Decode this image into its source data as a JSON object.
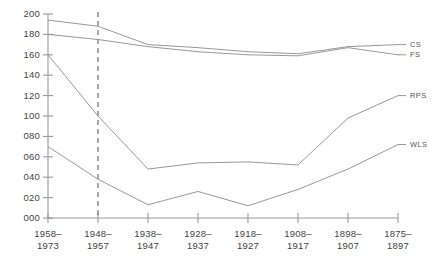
{
  "chart_data": {
    "type": "line",
    "title": "",
    "xlabel": "",
    "ylabel": "",
    "categories": [
      "1958–\n1973",
      "1948–\n1957",
      "1938–\n1947",
      "1928–\n1937",
      "1918–\n1927",
      "1908–\n1917",
      "1898–\n1907",
      "1875–\n1897"
    ],
    "category_lines": [
      [
        "1958–",
        "1973"
      ],
      [
        "1948–",
        "1957"
      ],
      [
        "1938–",
        "1947"
      ],
      [
        "1928–",
        "1937"
      ],
      [
        "1918–",
        "1927"
      ],
      [
        "1908–",
        "1917"
      ],
      [
        "1898–",
        "1907"
      ],
      [
        "1875–",
        "1897"
      ]
    ],
    "ylim": [
      0,
      200
    ],
    "ytick_labels": [
      "000",
      "020",
      "040",
      "060",
      "080",
      "100",
      "120",
      "140",
      "160",
      "180",
      "200"
    ],
    "ytick_values": [
      0,
      20,
      40,
      60,
      80,
      100,
      120,
      140,
      160,
      180,
      200
    ],
    "grid": false,
    "legend_position": "right-inline",
    "series": [
      {
        "name": "CS",
        "label": "CS",
        "values": [
          194,
          188,
          170,
          167,
          163,
          161,
          168,
          170
        ],
        "color": "#8c8c8c"
      },
      {
        "name": "FS",
        "label": "FS",
        "values": [
          180,
          175,
          168,
          163,
          160,
          159,
          167,
          160
        ],
        "color": "#8c8c8c"
      },
      {
        "name": "RPS",
        "label": "RPS",
        "values": [
          160,
          100,
          48,
          54,
          55,
          52,
          98,
          120
        ],
        "color": "#8c8c8c"
      },
      {
        "name": "WLS",
        "label": "WLS",
        "values": [
          70,
          38,
          13,
          26,
          12,
          28,
          48,
          72
        ],
        "color": "#8c8c8c"
      }
    ],
    "annotations": [
      {
        "type": "vertical-dashed-line",
        "at_category_index": 1,
        "label": ""
      }
    ],
    "axis_color": "#9a9a9a",
    "line_color": "#8c8c8c"
  }
}
